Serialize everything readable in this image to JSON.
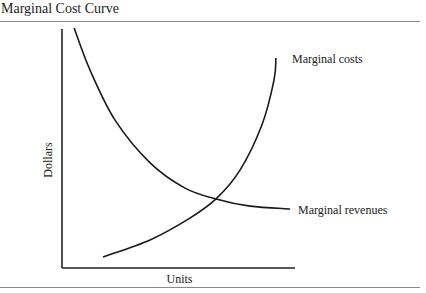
{
  "chart_data": {
    "type": "line",
    "title": "Marginal Cost Curve",
    "xlabel": "Units",
    "ylabel": "Dollars",
    "xlim": [
      0,
      10
    ],
    "ylim": [
      0,
      10
    ],
    "grid": false,
    "ticks": false,
    "series": [
      {
        "name": "Marginal costs",
        "label": "Marginal costs",
        "x": [
          1.76,
          3.78,
          5.49,
          6.61,
          7.64,
          8.58,
          9.1,
          9.18
        ],
        "y": [
          0.46,
          1.17,
          2.08,
          2.88,
          4.08,
          5.96,
          7.83,
          8.75
        ]
      },
      {
        "name": "Marginal revenues",
        "label": "Marginal revenues",
        "x": [
          0.52,
          1.2,
          2.27,
          3.78,
          5.28,
          6.61,
          8.07,
          9.79
        ],
        "y": [
          10.0,
          8.25,
          6.17,
          4.38,
          3.33,
          2.88,
          2.58,
          2.46
        ]
      }
    ],
    "annotations": [
      "Curves intersect where marginal costs equal marginal revenues"
    ]
  }
}
